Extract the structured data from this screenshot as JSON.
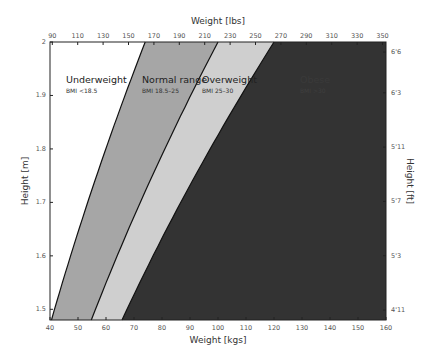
{
  "chart_data": {
    "type": "area",
    "title": "",
    "xlabel": "Weight [kgs]",
    "x2label": "Weight [lbs]",
    "ylabel": "Height [m]",
    "y2label": "Height [ft]",
    "xlim": [
      40,
      160
    ],
    "ylim": [
      1.48,
      2.0
    ],
    "x_ticks": [
      40,
      50,
      60,
      70,
      80,
      90,
      100,
      110,
      120,
      130,
      140,
      150,
      160
    ],
    "x2_ticks": [
      "90",
      "110",
      "130",
      "150",
      "170",
      "190",
      "210",
      "230",
      "250",
      "270",
      "290",
      "310",
      "330",
      "350"
    ],
    "y_ticks": [
      "1.5",
      "1.6",
      "1.7",
      "1.8",
      "1.9",
      "2"
    ],
    "y2_ticks": [
      "4'11",
      "5'3",
      "5'7",
      "5'11",
      "6'3",
      "6'6"
    ],
    "grid": false,
    "series": [
      {
        "name": "Underweight",
        "label": "BMI <18.5",
        "bmi_range": [
          0,
          18.5
        ],
        "color": "#ffffff"
      },
      {
        "name": "Normal range",
        "label": "BMI 18.5–25",
        "bmi_range": [
          18.5,
          25
        ],
        "color": "#a6a6a6"
      },
      {
        "name": "Overweight",
        "label": "BMI 25–30",
        "bmi_range": [
          25,
          30
        ],
        "color": "#cfcfcf"
      },
      {
        "name": "Obese",
        "label": "BMI >30",
        "bmi_range": [
          30,
          999
        ],
        "color": "#333333"
      }
    ],
    "boundaries": [
      {
        "bmi": 18.5,
        "points": [
          [
            40.6,
            1.481
          ],
          [
            46.3,
            1.58
          ],
          [
            52.3,
            1.68
          ],
          [
            58.7,
            1.78
          ],
          [
            65.4,
            1.88
          ],
          [
            74.0,
            2.0
          ]
        ]
      },
      {
        "bmi": 25,
        "points": [
          [
            54.8,
            1.481
          ],
          [
            62.4,
            1.58
          ],
          [
            70.6,
            1.68
          ],
          [
            79.2,
            1.78
          ],
          [
            88.4,
            1.88
          ],
          [
            100.0,
            2.0
          ]
        ]
      },
      {
        "bmi": 30,
        "points": [
          [
            65.8,
            1.481
          ],
          [
            74.9,
            1.58
          ],
          [
            84.7,
            1.68
          ],
          [
            95.1,
            1.78
          ],
          [
            106.0,
            1.88
          ],
          [
            120.0,
            2.0
          ]
        ]
      }
    ]
  }
}
